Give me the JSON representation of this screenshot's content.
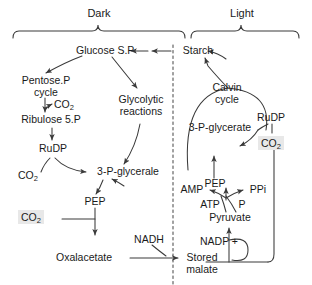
{
  "diagram": {
    "phases": {
      "dark": "Dark",
      "light": "Light"
    },
    "divider": "dashed-vertical-divider",
    "colors": {
      "stroke": "#3a3a3a",
      "text": "#1a1a1a",
      "highlight_bg": "#e8e8e8",
      "background": "#ffffff"
    },
    "nodes": {
      "glucose_sp": "Glucose S.P",
      "starch": "Starch",
      "pentose_p_cycle": "Pentose.P cycle",
      "co2_ribulose": "CO",
      "co2_ribulose_sub": "2",
      "ribulose_5p": "Ribulose 5.P",
      "rudp_left": "RuDP",
      "co2_rudp": "CO",
      "co2_rudp_sub": "2",
      "glycolytic_reactions": "Glycolytic reactions",
      "glycerate_left": "3-P-glycerale",
      "pep_left": "PEP",
      "co2_pep": "CO",
      "co2_pep_sub": "2",
      "nadh": "NADH",
      "oxalacetate": "Oxalacetate",
      "stored_malate": "Stored malate",
      "calvin_cycle": "Calvin cycle",
      "rudp_right": "RuDP",
      "glycerate_right": "3-P-glycerate",
      "co2_calvin": "CO",
      "co2_calvin_sub": "2",
      "pep_right": "PEP",
      "amp": "AMP",
      "ppi": "PPi",
      "atp": "ATP",
      "p": "P",
      "pyruvate": "Pyruvate",
      "nadp_plus": "NADP +"
    }
  }
}
